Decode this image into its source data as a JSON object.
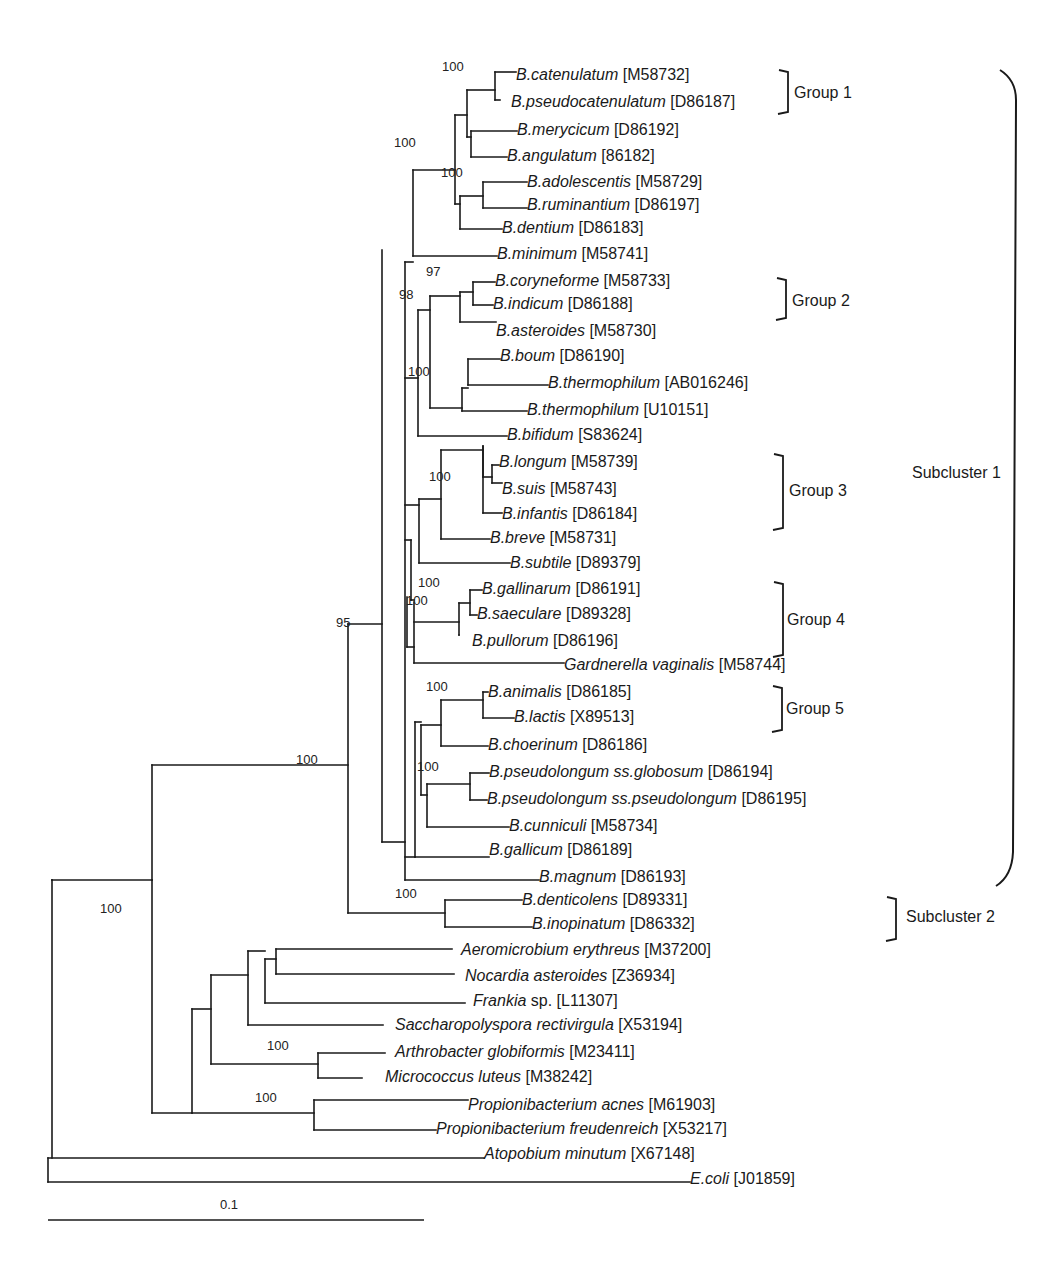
{
  "figure": {
    "type": "phylogenetic-tree",
    "scale_bar": {
      "label": "0.1",
      "x1": 48,
      "x2": 424,
      "y": 1220
    }
  },
  "taxa": [
    {
      "italic": "B.catenulatum",
      "acc": "[M58732]",
      "x": 516,
      "y": 76
    },
    {
      "italic": "B.pseudocatenulatum",
      "acc": "[D86187]",
      "x": 511,
      "y": 103
    },
    {
      "italic": "B.merycicum",
      "acc": "[D86192]",
      "x": 517,
      "y": 131
    },
    {
      "italic": "B.angulatum",
      "acc": "[86182]",
      "x": 507,
      "y": 157
    },
    {
      "italic": "B.adolescentis",
      "acc": "[M58729]",
      "x": 527,
      "y": 183
    },
    {
      "italic": "B.ruminantium",
      "acc": "[D86197]",
      "x": 527,
      "y": 206
    },
    {
      "italic": "B.dentium",
      "acc": "[D86183]",
      "x": 502,
      "y": 229
    },
    {
      "italic": "B.minimum",
      "acc": "[M58741]",
      "x": 497,
      "y": 255
    },
    {
      "italic": "B.coryneforme",
      "acc": "[M58733]",
      "x": 495,
      "y": 282
    },
    {
      "italic": "B.indicum",
      "acc": "[D86188]",
      "x": 493,
      "y": 305
    },
    {
      "italic": "B.asteroides",
      "acc": "[M58730]",
      "x": 496,
      "y": 332
    },
    {
      "italic": "B.boum",
      "acc": "[D86190]",
      "x": 500,
      "y": 357
    },
    {
      "italic": "B.thermophilum",
      "acc": "[AB016246]",
      "x": 548,
      "y": 384
    },
    {
      "italic": "B.thermophilum",
      "acc": "[U10151]",
      "x": 527,
      "y": 411
    },
    {
      "italic": "B.bifidum",
      "acc": "[S83624]",
      "x": 507,
      "y": 436
    },
    {
      "italic": "B.longum",
      "acc": "[M58739]",
      "x": 499,
      "y": 463
    },
    {
      "italic": "B.suis",
      "acc": "[M58743]",
      "x": 502,
      "y": 490
    },
    {
      "italic": "B.infantis",
      "acc": "[D86184]",
      "x": 502,
      "y": 515
    },
    {
      "italic": "B.breve",
      "acc": "[M58731]",
      "x": 490,
      "y": 539
    },
    {
      "italic": "B.subtile",
      "acc": "[D89379]",
      "x": 510,
      "y": 564
    },
    {
      "italic": "B.gallinarum",
      "acc": "[D86191]",
      "x": 482,
      "y": 590
    },
    {
      "italic": "B.saeculare",
      "acc": "[D89328]",
      "x": 477,
      "y": 615
    },
    {
      "italic": "B.pullorum",
      "acc": "[D86196]",
      "x": 472,
      "y": 642
    },
    {
      "italic": "Gardnerella vaginalis",
      "acc": "[M58744]",
      "x": 564,
      "y": 666
    },
    {
      "italic": "B.animalis",
      "acc": "[D86185]",
      "x": 488,
      "y": 693
    },
    {
      "italic": "B.lactis",
      "acc": "[X89513]",
      "x": 514,
      "y": 718
    },
    {
      "italic": "B.choerinum",
      "acc": "[D86186]",
      "x": 488,
      "y": 746
    },
    {
      "italic": "B.pseudolongum ss.globosum",
      "acc": "[D86194]",
      "x": 489,
      "y": 773
    },
    {
      "italic": "B.pseudolongum ss.pseudolongum",
      "acc": "[D86195]",
      "x": 487,
      "y": 800
    },
    {
      "italic": "B.cunniculi",
      "acc": "[M58734]",
      "x": 509,
      "y": 827
    },
    {
      "italic": "B.gallicum",
      "acc": "[D86189]",
      "x": 489,
      "y": 851
    },
    {
      "italic": "B.magnum",
      "acc": "[D86193]",
      "x": 539,
      "y": 878
    },
    {
      "italic": "B.denticolens",
      "acc": "[D89331]",
      "x": 522,
      "y": 901
    },
    {
      "italic": "B.inopinatum",
      "acc": "[D86332]",
      "x": 532,
      "y": 925
    },
    {
      "italic": "Aeromicrobium erythreus",
      "acc": "[M37200]",
      "x": 461,
      "y": 951
    },
    {
      "italic": "Nocardia asteroides",
      "acc": "[Z36934]",
      "x": 465,
      "y": 977
    },
    {
      "italic": "Frankia",
      "acc": "sp. [L11307]",
      "x": 473,
      "y": 1002
    },
    {
      "italic": "Saccharopolyspora rectivirgula",
      "acc": "[X53194]",
      "x": 395,
      "y": 1026
    },
    {
      "italic": "Arthrobacter globiformis",
      "acc": "[M23411]",
      "x": 395,
      "y": 1053
    },
    {
      "italic": "Micrococcus luteus",
      "acc": "[M38242]",
      "x": 385,
      "y": 1078
    },
    {
      "italic": "Propionibacterium acnes",
      "acc": "[M61903]",
      "x": 468,
      "y": 1106
    },
    {
      "italic": "Propionibacterium freudenreich",
      "acc": "[X53217]",
      "x": 436,
      "y": 1130
    },
    {
      "italic": "Atopobium minutum",
      "acc": "[X67148]",
      "x": 484,
      "y": 1155
    },
    {
      "italic": "E.coli",
      "acc": "[J01859]",
      "x": 690,
      "y": 1180
    }
  ],
  "bootstrap": [
    {
      "v": "100",
      "x": 468,
      "y": 66
    },
    {
      "v": "100",
      "x": 420,
      "y": 142
    },
    {
      "v": "100",
      "x": 467,
      "y": 172
    },
    {
      "v": "97",
      "x": 452,
      "y": 271
    },
    {
      "v": "98",
      "x": 425,
      "y": 294
    },
    {
      "v": "100",
      "x": 434,
      "y": 371
    },
    {
      "v": "100",
      "x": 455,
      "y": 476
    },
    {
      "v": "100",
      "x": 444,
      "y": 582
    },
    {
      "v": "100",
      "x": 432,
      "y": 600
    },
    {
      "v": "95",
      "x": 362,
      "y": 622
    },
    {
      "v": "100",
      "x": 322,
      "y": 759
    },
    {
      "v": "100",
      "x": 126,
      "y": 908
    },
    {
      "v": "100",
      "x": 452,
      "y": 686
    },
    {
      "v": "100",
      "x": 443,
      "y": 766
    },
    {
      "v": "100",
      "x": 421,
      "y": 893
    },
    {
      "v": "100",
      "x": 293,
      "y": 1045
    },
    {
      "v": "100",
      "x": 281,
      "y": 1097
    }
  ],
  "groups": [
    {
      "label": "Group 1",
      "bx": 788,
      "y1": 70,
      "y2": 114,
      "lx": 794,
      "ly": 84
    },
    {
      "label": "Group 2",
      "bx": 786,
      "y1": 278,
      "y2": 320,
      "lx": 792,
      "ly": 292
    },
    {
      "label": "Group 3",
      "bx": 783,
      "y1": 454,
      "y2": 530,
      "lx": 789,
      "ly": 482
    },
    {
      "label": "Group 4",
      "bx": 783,
      "y1": 582,
      "y2": 657,
      "lx": 787,
      "ly": 611
    },
    {
      "label": "Group 5",
      "bx": 782,
      "y1": 686,
      "y2": 732,
      "lx": 786,
      "ly": 700
    },
    {
      "label": "Subcluster 2",
      "bx": 896,
      "y1": 897,
      "y2": 941,
      "lx": 906,
      "ly": 908
    }
  ],
  "subcluster1": {
    "label": "Subcluster 1",
    "lx": 912,
    "ly": 464
  },
  "chart_data": {
    "type": "tree",
    "title": "",
    "scale_bar": "0.1",
    "clades": {
      "Subcluster 1": {
        "Group 1": [
          "B.catenulatum [M58732]",
          "B.pseudocatenulatum [D86187]"
        ],
        "Group 2": [
          "B.coryneforme [M58733]",
          "B.indicum [D86188]"
        ],
        "Group 3": [
          "B.longum [M58739]",
          "B.suis [M58743]",
          "B.infantis [D86184]"
        ],
        "Group 4": [
          "B.gallinarum [D86191]",
          "B.saeculare [D89328]",
          "B.pullorum [D86196]"
        ],
        "Group 5": [
          "B.animalis [D86185]",
          "B.lactis [X89513]"
        ]
      },
      "Subcluster 2": [
        "B.denticolens [D89331]",
        "B.inopinatum [D86332]"
      ]
    },
    "bootstrap_values": [
      100,
      100,
      100,
      97,
      98,
      100,
      100,
      100,
      100,
      95,
      100,
      100,
      100,
      100,
      100,
      100,
      100
    ],
    "segments": [
      [
        48,
        1158,
        48,
        1182
      ],
      [
        48,
        1158,
        484,
        1158
      ],
      [
        48,
        1182,
        690,
        1182
      ],
      [
        52,
        880,
        52,
        1158
      ],
      [
        52,
        880,
        152,
        880
      ],
      [
        52,
        880,
        52,
        880
      ],
      [
        152,
        880,
        152,
        1113
      ],
      [
        152,
        880,
        152,
        765
      ],
      [
        152,
        765,
        348,
        765
      ],
      [
        152,
        1113,
        192,
        1113
      ],
      [
        348,
        624,
        348,
        913
      ],
      [
        348,
        913,
        445,
        913
      ],
      [
        445,
        900,
        445,
        927
      ],
      [
        445,
        900,
        522,
        900
      ],
      [
        445,
        927,
        532,
        927
      ],
      [
        348,
        624,
        382,
        624
      ],
      [
        382,
        250,
        382,
        842
      ],
      [
        382,
        842,
        405,
        842
      ],
      [
        405,
        262,
        405,
        880
      ],
      [
        405,
        880,
        539,
        880
      ],
      [
        405,
        262,
        413,
        262
      ],
      [
        413,
        170,
        413,
        256
      ],
      [
        413,
        256,
        497,
        256
      ],
      [
        413,
        170,
        455,
        170
      ],
      [
        455,
        115,
        455,
        204
      ],
      [
        455,
        115,
        467,
        115
      ],
      [
        467,
        90,
        467,
        137
      ],
      [
        467,
        90,
        495,
        90
      ],
      [
        495,
        72,
        495,
        100
      ],
      [
        495,
        72,
        516,
        72
      ],
      [
        495,
        100,
        500,
        100
      ],
      [
        467,
        137,
        471,
        137
      ],
      [
        471,
        131,
        471,
        157
      ],
      [
        471,
        131,
        517,
        131
      ],
      [
        471,
        157,
        507,
        157
      ],
      [
        455,
        204,
        460,
        204
      ],
      [
        460,
        196,
        460,
        229
      ],
      [
        460,
        229,
        502,
        229
      ],
      [
        460,
        196,
        483,
        196
      ],
      [
        483,
        182,
        483,
        208
      ],
      [
        483,
        182,
        527,
        182
      ],
      [
        483,
        208,
        527,
        208
      ],
      [
        405,
        378,
        418,
        378
      ],
      [
        418,
        310,
        418,
        436
      ],
      [
        418,
        436,
        507,
        436
      ],
      [
        418,
        310,
        430,
        310
      ],
      [
        430,
        296,
        430,
        408
      ],
      [
        430,
        296,
        460,
        296
      ],
      [
        460,
        292,
        460,
        322
      ],
      [
        460,
        322,
        496,
        322
      ],
      [
        460,
        292,
        473,
        292
      ],
      [
        473,
        282,
        473,
        305
      ],
      [
        473,
        282,
        495,
        282
      ],
      [
        473,
        305,
        493,
        305
      ],
      [
        430,
        408,
        462,
        408
      ],
      [
        462,
        388,
        462,
        411
      ],
      [
        462,
        411,
        527,
        411
      ],
      [
        462,
        388,
        468,
        388
      ],
      [
        468,
        359,
        468,
        385
      ],
      [
        468,
        359,
        500,
        359
      ],
      [
        468,
        385,
        548,
        385
      ],
      [
        405,
        540,
        411,
        540
      ],
      [
        411,
        540,
        411,
        600
      ],
      [
        405,
        505,
        419,
        505
      ],
      [
        419,
        499,
        419,
        563
      ],
      [
        419,
        563,
        510,
        563
      ],
      [
        419,
        499,
        441,
        499
      ],
      [
        441,
        450,
        441,
        539
      ],
      [
        441,
        539,
        490,
        539
      ],
      [
        441,
        450,
        483,
        450
      ],
      [
        483,
        446,
        483,
        477
      ],
      [
        483,
        477,
        492,
        477
      ],
      [
        492,
        465,
        492,
        483
      ],
      [
        492,
        465,
        499,
        465
      ],
      [
        492,
        483,
        502,
        483
      ],
      [
        483,
        446,
        483,
        513
      ],
      [
        483,
        513,
        502,
        513
      ],
      [
        407,
        597,
        407,
        647
      ],
      [
        407,
        647,
        414,
        647
      ],
      [
        411,
        600,
        411,
        600
      ],
      [
        411,
        600,
        414,
        600
      ],
      [
        414,
        602,
        414,
        663
      ],
      [
        414,
        663,
        564,
        663
      ],
      [
        414,
        622,
        459,
        622
      ],
      [
        459,
        603,
        459,
        635
      ],
      [
        459,
        603,
        470,
        603
      ],
      [
        470,
        590,
        470,
        615
      ],
      [
        470,
        590,
        482,
        590
      ],
      [
        470,
        615,
        477,
        615
      ],
      [
        459,
        635,
        459,
        635
      ],
      [
        405,
        857,
        415,
        857
      ],
      [
        415,
        722,
        415,
        857
      ],
      [
        415,
        857,
        489,
        857
      ],
      [
        415,
        722,
        421,
        722
      ],
      [
        421,
        725,
        421,
        795
      ],
      [
        421,
        725,
        441,
        725
      ],
      [
        441,
        700,
        441,
        746
      ],
      [
        441,
        746,
        488,
        746
      ],
      [
        441,
        700,
        483,
        700
      ],
      [
        483,
        692,
        483,
        718
      ],
      [
        483,
        692,
        488,
        692
      ],
      [
        483,
        718,
        514,
        718
      ],
      [
        421,
        795,
        427,
        795
      ],
      [
        427,
        784,
        427,
        827
      ],
      [
        427,
        827,
        509,
        827
      ],
      [
        427,
        784,
        470,
        784
      ],
      [
        470,
        773,
        470,
        800
      ],
      [
        470,
        773,
        489,
        773
      ],
      [
        470,
        800,
        487,
        800
      ],
      [
        192,
        1009,
        192,
        1113
      ],
      [
        192,
        1113,
        314,
        1113
      ],
      [
        314,
        1100,
        314,
        1130
      ],
      [
        314,
        1100,
        468,
        1100
      ],
      [
        314,
        1130,
        436,
        1130
      ],
      [
        192,
        1009,
        211,
        1009
      ],
      [
        211,
        975,
        211,
        1064
      ],
      [
        211,
        1064,
        318,
        1064
      ],
      [
        318,
        1053,
        318,
        1078
      ],
      [
        318,
        1053,
        385,
        1053
      ],
      [
        318,
        1078,
        362,
        1078
      ],
      [
        211,
        975,
        248,
        975
      ],
      [
        248,
        951,
        248,
        1025
      ],
      [
        248,
        1025,
        383,
        1025
      ],
      [
        248,
        951,
        265,
        951
      ],
      [
        265,
        959,
        265,
        1003
      ],
      [
        265,
        1003,
        465,
        1003
      ],
      [
        265,
        959,
        276,
        959
      ],
      [
        276,
        949,
        276,
        974
      ],
      [
        276,
        949,
        452,
        949
      ],
      [
        276,
        974,
        454,
        974
      ]
    ]
  }
}
